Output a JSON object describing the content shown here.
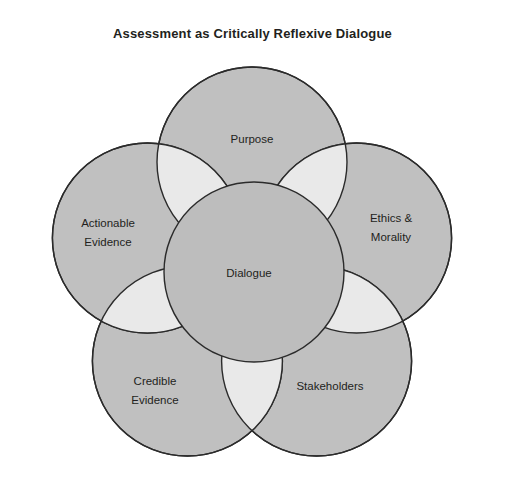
{
  "figure": {
    "title": "Assessment as Critically Reflexive Dialogue",
    "background_color": "#ffffff",
    "petal_fill": "#c0c0c0",
    "overlap_fill": "#e9e9e9",
    "stroke_color": "#2b2b2b",
    "center_fill": "#bdbdbd"
  },
  "center": {
    "label": "Dialogue"
  },
  "petals": [
    {
      "id": "purpose",
      "label": "Purpose",
      "line1": "Purpose",
      "line2": ""
    },
    {
      "id": "ethics-morality",
      "label": "Ethics & Morality",
      "line1": "Ethics &",
      "line2": "Morality"
    },
    {
      "id": "stakeholders",
      "label": "Stakeholders",
      "line1": "Stakeholders",
      "line2": ""
    },
    {
      "id": "credible-evidence",
      "label": "Credible Evidence",
      "line1": "Credible",
      "line2": "Evidence"
    },
    {
      "id": "actionable-evidence",
      "label": "Actionable Evidence",
      "line1": "Actionable",
      "line2": "Evidence"
    }
  ]
}
